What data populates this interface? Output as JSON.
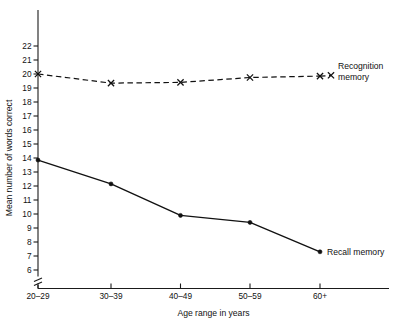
{
  "chart_data": {
    "type": "line",
    "title": "",
    "xlabel": "Age range in years",
    "ylabel": "Mean number of words correct",
    "categories": [
      "20–29",
      "30–39",
      "40–49",
      "50–59",
      "60+"
    ],
    "ylim": [
      6,
      22
    ],
    "yticks": [
      6,
      7,
      8,
      9,
      10,
      11,
      12,
      13,
      14,
      15,
      16,
      17,
      18,
      19,
      20,
      21,
      22
    ],
    "ytick_labels": [
      "6",
      "7",
      "8",
      "9",
      "10",
      "11",
      "12",
      "13",
      "14",
      "15",
      "16",
      "17",
      "18",
      "19",
      "20",
      "21",
      "22"
    ],
    "axis_break": true,
    "grid": false,
    "legend_position": "inline-right",
    "series": [
      {
        "name": "Recognition memory",
        "label_line1": "Recognition",
        "label_line2": "memory",
        "values": [
          20.0,
          19.35,
          19.4,
          19.75,
          19.85
        ],
        "style": "dashed",
        "marker": "x",
        "color": "#111111"
      },
      {
        "name": "Recall memory",
        "label_line1": "Recall memory",
        "label_line2": "",
        "values": [
          13.85,
          12.15,
          9.9,
          9.4,
          7.3
        ],
        "style": "solid",
        "marker": "dot",
        "color": "#111111"
      }
    ]
  },
  "axes": {
    "xlabel": "Age range in years",
    "ylabel": "Mean number of words correct"
  },
  "labels": {
    "recognition_line1": "Recognition",
    "recognition_line2": "memory",
    "recall": "Recall memory"
  },
  "ticks": {
    "x": [
      "20–29",
      "30–39",
      "40–49",
      "50–59",
      "60+"
    ],
    "y": [
      "22",
      "21",
      "20",
      "19",
      "18",
      "17",
      "16",
      "15",
      "14",
      "13",
      "12",
      "11",
      "10",
      "9",
      "8",
      "7",
      "6"
    ]
  }
}
